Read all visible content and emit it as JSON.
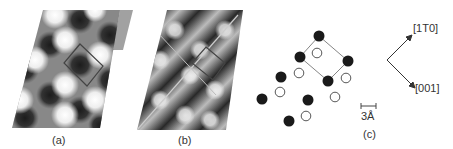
{
  "figure": {
    "panels": [
      {
        "id": "a",
        "label": "(a)",
        "description": "STM image, checkerboard pattern with square unit cell"
      },
      {
        "id": "b",
        "label": "(b)",
        "description": "STM image, stripe pattern with rectangular unit cell and domain lines"
      },
      {
        "id": "c",
        "label": "(c)",
        "description": "Structural model: filled and open circles with unit cell"
      }
    ],
    "scale_bar": {
      "label": "3Å"
    },
    "directions": [
      {
        "label": "[1T0]",
        "direction": "up-right"
      },
      {
        "label": "[001]",
        "direction": "down-right"
      }
    ],
    "atoms": {
      "filled": [
        [
          319,
          36
        ],
        [
          300,
          57
        ],
        [
          281,
          77
        ],
        [
          262,
          99
        ],
        [
          348,
          61
        ],
        [
          328,
          81
        ],
        [
          308,
          100
        ],
        [
          289,
          121
        ]
      ],
      "open": [
        [
          317,
          53
        ],
        [
          299,
          73
        ],
        [
          280,
          92
        ],
        [
          346,
          78
        ],
        [
          335,
          97
        ],
        [
          306,
          116
        ]
      ]
    },
    "colors": {
      "dark": "#1a1a1a",
      "line": "#555555"
    }
  }
}
